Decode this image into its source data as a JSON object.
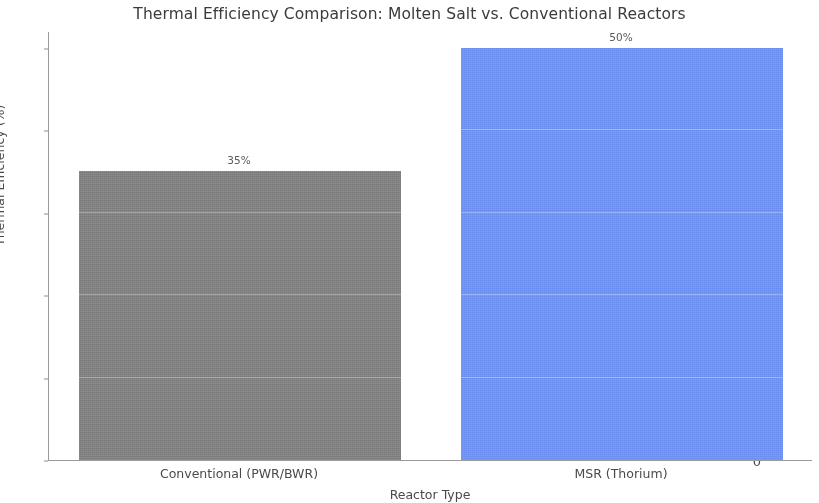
{
  "chart_data": {
    "type": "bar",
    "title": "Thermal Efficiency Comparison: Molten Salt vs. Conventional Reactors",
    "xlabel": "Reactor Type",
    "ylabel": "Thermal Efficiency (%)",
    "categories": [
      "Conventional (PWR/BWR)",
      "MSR (Thorium)"
    ],
    "values": [
      35,
      50
    ],
    "value_labels": [
      "35%",
      "50%"
    ],
    "colors": [
      "#808080",
      "#6e93f0"
    ],
    "ylim": [
      0,
      52
    ],
    "yticks": [
      0,
      10,
      20,
      30,
      40,
      50
    ],
    "ytick_labels": [
      "0",
      "10",
      "20",
      "30",
      "40",
      "50"
    ],
    "grid": false,
    "legend": null,
    "series": [
      {
        "name": "Thermal Efficiency (%)",
        "values": [
          35,
          50
        ]
      }
    ]
  },
  "axis": {
    "tick_color": "#8e8e8e",
    "spine_color": "#9a9a9a"
  }
}
